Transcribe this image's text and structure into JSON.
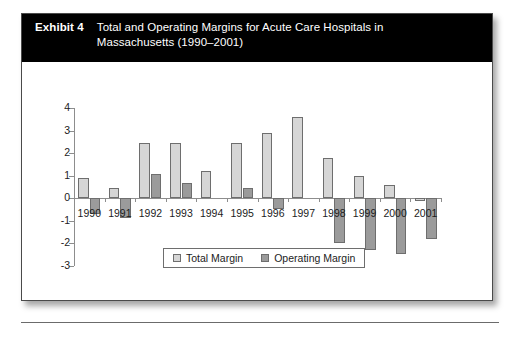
{
  "exhibit": {
    "label": "Exhibit 4",
    "title": "Total and Operating Margins for Acute Care Hospitals in Massachusetts (1990–2001)"
  },
  "legend": {
    "position": "bottom-center",
    "items": [
      {
        "label": "Total Margin",
        "color": "#d6d6d6",
        "swatch": "light-gray-square"
      },
      {
        "label": "Operating Margin",
        "color": "#9b9b9b",
        "swatch": "dark-gray-square"
      }
    ]
  },
  "chart_data": {
    "type": "bar",
    "title": "Total and Operating Margins for Acute Care Hospitals in Massachusetts (1990–2001)",
    "xlabel": "",
    "ylabel": "",
    "ylim": [
      -3,
      4
    ],
    "yticks": [
      4,
      3,
      2,
      1,
      0,
      -1,
      -2,
      -3
    ],
    "ytick_labels": [
      "4",
      "3",
      "2",
      "1",
      "0",
      "-1",
      "-2",
      "-3"
    ],
    "grid": false,
    "categories": [
      "1990",
      "1991",
      "1992",
      "1993",
      "1994",
      "1995",
      "1996",
      "1997",
      "1998",
      "1999",
      "2000",
      "2001"
    ],
    "series": [
      {
        "name": "Total Margin",
        "color": "#d6d6d6",
        "values": [
          0.9,
          0.45,
          2.45,
          2.45,
          1.2,
          2.45,
          2.9,
          3.6,
          1.8,
          1.0,
          0.6,
          -0.15
        ]
      },
      {
        "name": "Operating Margin",
        "color": "#9b9b9b",
        "values": [
          -0.7,
          -0.9,
          1.05,
          0.65,
          0.0,
          0.45,
          -0.5,
          0.0,
          -2.0,
          -2.3,
          -2.5,
          -1.8
        ]
      }
    ]
  }
}
